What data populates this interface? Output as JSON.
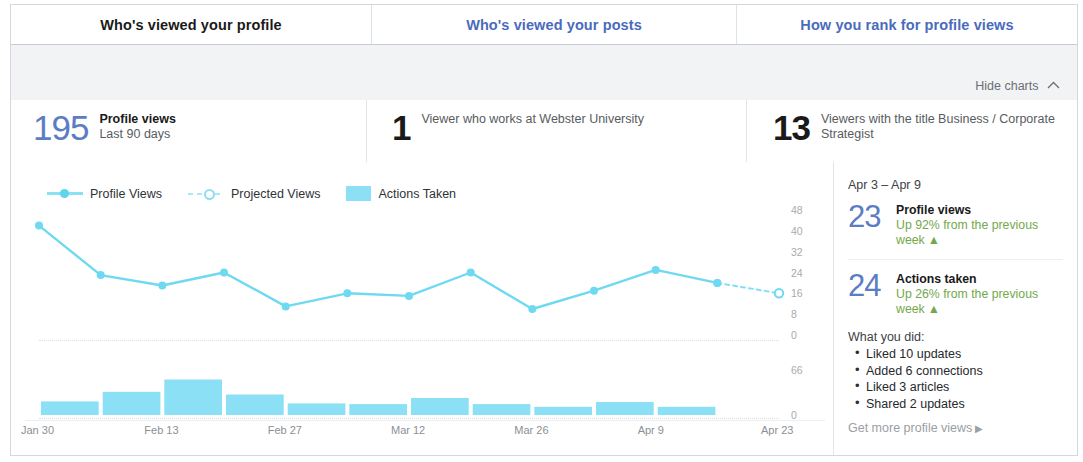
{
  "tabs": [
    {
      "label": "Who's viewed your profile",
      "active": true
    },
    {
      "label": "Who's viewed your posts",
      "active": false
    },
    {
      "label": "How you rank for profile views",
      "active": false
    }
  ],
  "toolbar": {
    "hide_charts_label": "Hide charts",
    "chevron_icon": "chevron-up-icon"
  },
  "stats": [
    {
      "value": "195",
      "title": "Profile views",
      "subtitle": "Last 90 days",
      "style": "blue"
    },
    {
      "value": "1",
      "title": "Viewer who works at Webster University",
      "subtitle": "",
      "style": "dark"
    },
    {
      "value": "13",
      "title": "Viewers with the title Business / Corporate Strategist",
      "subtitle": "",
      "style": "dark"
    }
  ],
  "legend": [
    {
      "label": "Profile Views",
      "marker": "solid-line"
    },
    {
      "label": "Projected Views",
      "marker": "dashed-line"
    },
    {
      "label": "Actions Taken",
      "marker": "swatch"
    }
  ],
  "sidebar": {
    "week_range": "Apr 3 – Apr 9",
    "week_stats": [
      {
        "value": "23",
        "title": "Profile views",
        "delta": "Up 92% from the previous week",
        "delta_direction": "up"
      },
      {
        "value": "24",
        "title": "Actions taken",
        "delta": "Up 26% from the previous week",
        "delta_direction": "up"
      }
    ],
    "what_you_did_title": "What you did:",
    "what_you_did": [
      "Liked 10 updates",
      "Added 6 connections",
      "Liked 3 articles",
      "Shared 2 updates"
    ],
    "get_more_label": "Get more profile views",
    "get_more_caret": "caret-right-icon"
  },
  "colors": {
    "accent_blue": "#5c7cc4",
    "link_blue": "#4a6bbd",
    "cyan_line": "#6fd9f2",
    "cyan_bar": "#8ce0f5",
    "green_delta": "#74a84b",
    "panel_border": "#d4d8de"
  },
  "chart_data": [
    {
      "type": "line",
      "title": "Profile Views",
      "xlabel": "",
      "ylabel": "",
      "ylim": [
        0,
        48
      ],
      "yticks": [
        0,
        8,
        16,
        24,
        32,
        40,
        48
      ],
      "grid": false,
      "legend_position": "top-left",
      "x": [
        "Jan 30",
        "Feb 6",
        "Feb 13",
        "Feb 20",
        "Feb 27",
        "Mar 5",
        "Mar 12",
        "Mar 19",
        "Mar 26",
        "Apr 2",
        "Apr 9",
        "Apr 16",
        "Apr 23"
      ],
      "xticks": [
        "Jan 30",
        "Feb 13",
        "Feb 27",
        "Mar 12",
        "Mar 26",
        "Apr 9",
        "Apr 23"
      ],
      "series": [
        {
          "name": "Profile Views",
          "style": "solid",
          "values": [
            42,
            23,
            19,
            24,
            11,
            16,
            15,
            24,
            10,
            17,
            25,
            20,
            null
          ]
        },
        {
          "name": "Projected Views",
          "style": "dashed",
          "values": [
            null,
            null,
            null,
            null,
            null,
            null,
            null,
            null,
            null,
            null,
            null,
            20,
            16
          ]
        }
      ]
    },
    {
      "type": "bar",
      "title": "Actions Taken",
      "xlabel": "",
      "ylabel": "",
      "ylim": [
        0,
        66
      ],
      "yticks": [
        0,
        66
      ],
      "grid": false,
      "categories": [
        "Jan 30",
        "Feb 6",
        "Feb 13",
        "Feb 20",
        "Feb 27",
        "Mar 5",
        "Mar 12",
        "Mar 19",
        "Mar 26",
        "Apr 2",
        "Apr 9",
        "Apr 16"
      ],
      "values": [
        20,
        34,
        52,
        30,
        17,
        16,
        25,
        16,
        12,
        19,
        12,
        0
      ]
    }
  ]
}
